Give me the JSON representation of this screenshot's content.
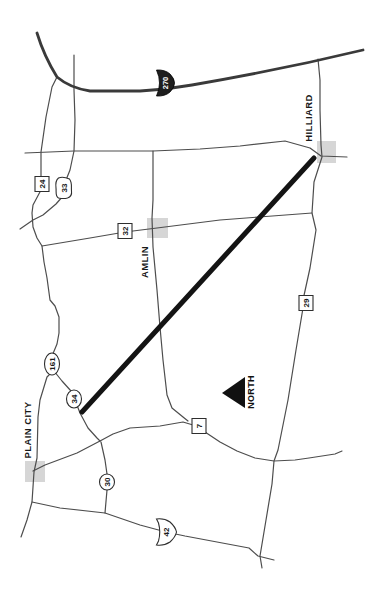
{
  "map": {
    "colors": {
      "background": "#ffffff",
      "road": "#4d4d4d",
      "major_road": "#3a3a3a",
      "highlight_route": "#141414",
      "city_marker": "#d6d6d6",
      "interstate_shield_fill": "#1e1e1e"
    },
    "cities": [
      {
        "id": "hilliard",
        "name": "HILLIARD",
        "label_x": 312,
        "label_y": 118,
        "marker": {
          "x": 317,
          "y": 141,
          "w": 19,
          "h": 22
        }
      },
      {
        "id": "amlin",
        "name": "AMLIN",
        "label_x": 148,
        "label_y": 262,
        "marker": {
          "x": 147,
          "y": 218,
          "w": 21,
          "h": 20
        }
      },
      {
        "id": "plain-city",
        "name": "PLAIN CITY",
        "label_x": 31,
        "label_y": 430,
        "marker": {
          "x": 25,
          "y": 461,
          "w": 20,
          "h": 21
        }
      }
    ],
    "north_arrow": {
      "label": "NORTH",
      "text_x": 254,
      "text_y": 392,
      "triangle": "222,393 245,377 245,408"
    },
    "route_markers": [
      {
        "shape": "interstate",
        "label": "270",
        "x": 165,
        "y": 83
      },
      {
        "shape": "square",
        "label": "24",
        "x": 42,
        "y": 184
      },
      {
        "shape": "ohio",
        "label": "33",
        "x": 64,
        "y": 188
      },
      {
        "shape": "square",
        "label": "32",
        "x": 125,
        "y": 231
      },
      {
        "shape": "square",
        "label": "29",
        "x": 306,
        "y": 303
      },
      {
        "shape": "ellipse",
        "label": "161",
        "x": 52,
        "y": 364,
        "rx": 11,
        "ry": 7.5
      },
      {
        "shape": "ellipse",
        "label": "34",
        "x": 74,
        "y": 399,
        "rx": 9,
        "ry": 7.5
      },
      {
        "shape": "square",
        "label": "7",
        "x": 199,
        "y": 426
      },
      {
        "shape": "ellipse",
        "label": "30",
        "x": 107,
        "y": 482,
        "rx": 8,
        "ry": 7.5
      },
      {
        "shape": "us",
        "label": "42",
        "x": 166,
        "y": 532
      }
    ]
  }
}
